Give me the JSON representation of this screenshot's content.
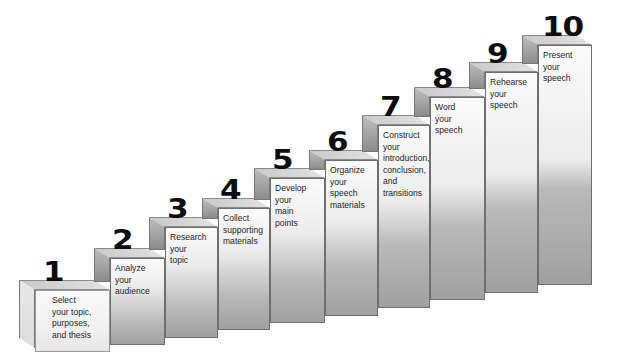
{
  "diagram": {
    "type": "staircase",
    "title": "",
    "steps": [
      {
        "number": "1",
        "label": "Select\nyour topic,\npurposes,\nand thesis"
      },
      {
        "number": "2",
        "label": "Analyze\nyour\naudience"
      },
      {
        "number": "3",
        "label": "Research\nyour\ntopic"
      },
      {
        "number": "4",
        "label": "Collect\nsupporting\nmaterials"
      },
      {
        "number": "5",
        "label": "Develop\nyour\nmain\npoints"
      },
      {
        "number": "6",
        "label": "Organize\nyour\nspeech\nmaterials"
      },
      {
        "number": "7",
        "label": "Construct\nyour\nintroduction,\nconclusion,\nand\ntransitions"
      },
      {
        "number": "8",
        "label": "Word\nyour\nspeech"
      },
      {
        "number": "9",
        "label": "Rehearse\nyour\nspeech"
      },
      {
        "number": "10",
        "label": "Present\nyour\nspeech"
      }
    ],
    "colors": {
      "face_light": "#fbfbfb",
      "face_dark": "#a4a4a4",
      "number": "#0d0d0d",
      "text": "#262626"
    }
  }
}
